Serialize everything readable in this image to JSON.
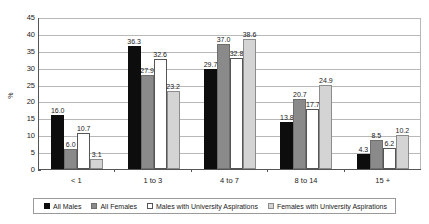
{
  "chart_data": {
    "type": "bar",
    "title": "",
    "xlabel": "",
    "ylabel": "%",
    "ylim": [
      0,
      45
    ],
    "ytick_step": 5,
    "yticks": [
      0,
      5,
      10,
      15,
      20,
      25,
      30,
      35,
      40,
      45
    ],
    "grid": true,
    "legend_position": "bottom",
    "categories": [
      "< 1",
      "1 to 3",
      "4 to 7",
      "8 to 14",
      "15 +"
    ],
    "series": [
      {
        "name": "All Males",
        "color": "#0d0d0d",
        "values": [
          16.0,
          36.3,
          29.7,
          13.8,
          4.3
        ],
        "labels": [
          "16.0",
          "36.3",
          "29.7",
          "13.8",
          "4.3"
        ]
      },
      {
        "name": "All Females",
        "color": "#8a8a8a",
        "values": [
          6.0,
          27.9,
          37.0,
          20.7,
          8.5
        ],
        "labels": [
          "6.0",
          "27.9",
          "37.0",
          "20.7",
          "8.5"
        ]
      },
      {
        "name": "Males with University Aspirations",
        "color": "#ffffff",
        "values": [
          10.7,
          32.6,
          32.8,
          17.7,
          6.2
        ],
        "labels": [
          "10.7",
          "32.6",
          "32.8",
          "17.7",
          "6.2"
        ]
      },
      {
        "name": "Females with University Aspirations",
        "color": "#d4d4d4",
        "values": [
          3.1,
          23.2,
          38.6,
          24.9,
          10.2
        ],
        "labels": [
          "3.1",
          "23.2",
          "38.6",
          "24.9",
          "10.2"
        ]
      }
    ]
  }
}
